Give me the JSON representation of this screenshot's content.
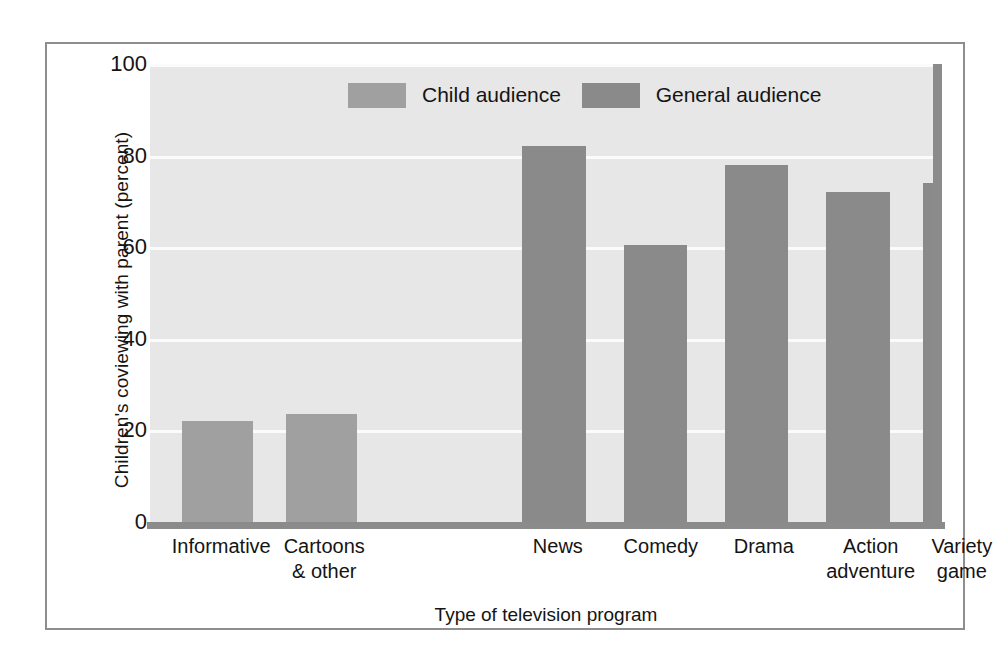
{
  "chart_data": {
    "type": "bar",
    "title": "",
    "xlabel": "Type of television program",
    "ylabel": "Children's coviewing with parent (percent)",
    "ylim": [
      0,
      100
    ],
    "yticks": [
      0,
      20,
      40,
      60,
      80,
      100
    ],
    "grid": true,
    "categories": [
      "Informative",
      "Cartoons & other",
      "News",
      "Comedy",
      "Drama",
      "Action adventure",
      "Variety game"
    ],
    "category_lines": [
      [
        "Informative"
      ],
      [
        "Cartoons",
        "& other"
      ],
      [
        "News"
      ],
      [
        "Comedy"
      ],
      [
        "Drama"
      ],
      [
        "Action",
        "adventure"
      ],
      [
        "Variety",
        "game"
      ]
    ],
    "values": [
      22,
      23.5,
      82,
      60.5,
      78,
      72,
      74
    ],
    "series_assignment": [
      "Child audience",
      "Child audience",
      "General audience",
      "General audience",
      "General audience",
      "General audience",
      "General audience"
    ],
    "legend": {
      "position": "top-inside",
      "entries": [
        {
          "label": "Child audience",
          "color": "#a0a0a0"
        },
        {
          "label": "General audience",
          "color": "#8a8a8a"
        }
      ]
    },
    "bar_geometry": [
      {
        "left_pct": 4.0,
        "width_pct": 9.0
      },
      {
        "left_pct": 17.2,
        "width_pct": 9.0
      },
      {
        "left_pct": 47.0,
        "width_pct": 8.0
      },
      {
        "left_pct": 59.8,
        "width_pct": 8.0
      },
      {
        "left_pct": 72.6,
        "width_pct": 8.0
      },
      {
        "left_pct": 85.4,
        "width_pct": 8.0
      },
      {
        "left_pct": 97.6,
        "width_pct": 8.0
      }
    ],
    "tick_geometry": [
      {
        "left_pct": -2.0,
        "width_pct": 22.0
      },
      {
        "left_pct": 11.0,
        "width_pct": 22.0
      },
      {
        "left_pct": 41.0,
        "width_pct": 21.0
      },
      {
        "left_pct": 54.0,
        "width_pct": 21.0
      },
      {
        "left_pct": 67.0,
        "width_pct": 21.0
      },
      {
        "left_pct": 79.5,
        "width_pct": 23.0
      },
      {
        "left_pct": 92.0,
        "width_pct": 21.0
      }
    ],
    "legend_geometry": [
      {
        "left_pct": 25.0
      },
      {
        "left_pct": 54.5
      }
    ],
    "colors": {
      "plot_background": "#e7e7e7",
      "gridline": "#fbfbfb",
      "axis": "#8b8b8b",
      "frame": "#8e8e8e",
      "page_background": "#ffffff",
      "text": "#141414"
    }
  }
}
